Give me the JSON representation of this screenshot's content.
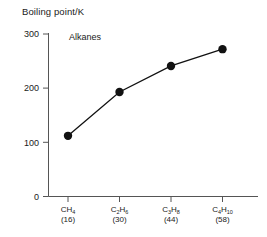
{
  "chart_data": {
    "type": "line",
    "title": "",
    "annotation": "Alkanes",
    "ylabel": "Boiling point/K",
    "xlabel": "",
    "categories": [
      "CH4",
      "C2H6",
      "C3H8",
      "C4H10"
    ],
    "category_labels": [
      {
        "formula_main": "CH",
        "formula_sub": "4",
        "formula_tail": "",
        "mass": "(16)"
      },
      {
        "formula_main": "C",
        "formula_sub": "2",
        "formula_tail": "H",
        "formula_sub2": "6",
        "mass": "(30)"
      },
      {
        "formula_main": "C",
        "formula_sub": "3",
        "formula_tail": "H",
        "formula_sub2": "8",
        "mass": "(44)"
      },
      {
        "formula_main": "C",
        "formula_sub": "4",
        "formula_tail": "H",
        "formula_sub2": "10",
        "mass": "(58)"
      }
    ],
    "molar_masses": [
      16,
      30,
      44,
      58
    ],
    "values": [
      112,
      193,
      241,
      272
    ],
    "ylim": [
      0,
      320
    ],
    "yticks": [
      0,
      100,
      200,
      300
    ],
    "ytick_labels": [
      "0",
      "100",
      "200",
      "300"
    ],
    "grid": false,
    "legend": false,
    "marker": "filled-circle",
    "line_color": "#111111",
    "marker_color": "#111111",
    "axis_color": "#555555",
    "background": "#ffffff"
  }
}
